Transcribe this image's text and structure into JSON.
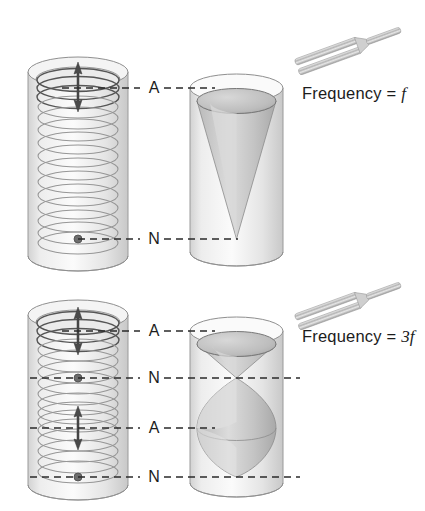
{
  "diagram": {
    "type": "physics-illustration",
    "background_color": "#ffffff",
    "ink_color": "#1c1c1c",
    "tube_fill_color": "#e8e8e8",
    "cone_fill_color": "#c9c9c9",
    "helix_color": "#8a8a8a"
  },
  "panels": [
    {
      "id": "fundamental",
      "frequency_label": {
        "prefix": "Frequency = ",
        "symbol": "f"
      },
      "tuning_fork": {
        "icon": "tuning-fork-icon",
        "tine_count": 2
      },
      "left_tube": {
        "icon": "cylinder-with-helix-icon",
        "helix_turn_count": 13,
        "markers": [
          {
            "type": "antinode",
            "icon": "double-arrow-icon",
            "y_fraction": 0.07
          },
          {
            "type": "node",
            "icon": "dot-icon",
            "y_fraction": 0.93
          }
        ]
      },
      "right_tube": {
        "icon": "cylinder-with-cone-icon",
        "cone_count": 1,
        "description": "single cone apex at bottom node"
      },
      "markers": [
        {
          "label": "A",
          "name": "antinode",
          "y": 88
        },
        {
          "label": "N",
          "name": "node",
          "y": 239
        }
      ]
    },
    {
      "id": "third-harmonic",
      "frequency_label": {
        "prefix": "Frequency = ",
        "symbol": "3f"
      },
      "tuning_fork": {
        "icon": "tuning-fork-icon",
        "tine_count": 2
      },
      "left_tube": {
        "icon": "cylinder-with-helix-icon",
        "helix_turn_count": 13,
        "markers": [
          {
            "type": "antinode",
            "icon": "double-arrow-icon",
            "y_fraction": 0.07
          },
          {
            "type": "node",
            "icon": "dot-icon",
            "y_fraction": 0.38
          },
          {
            "type": "antinode",
            "icon": "double-arrow-icon",
            "y_fraction": 0.65
          },
          {
            "type": "node",
            "icon": "dot-icon",
            "y_fraction": 0.95
          }
        ]
      },
      "right_tube": {
        "icon": "cylinder-with-double-cone-icon",
        "cone_count": 3,
        "description": "cone, waist node, lens-shaped lobe"
      },
      "markers": [
        {
          "label": "A",
          "name": "antinode",
          "y": 331
        },
        {
          "label": "N",
          "name": "node",
          "y": 378
        },
        {
          "label": "A",
          "name": "antinode",
          "y": 428
        },
        {
          "label": "N",
          "name": "node",
          "y": 477
        }
      ]
    }
  ]
}
